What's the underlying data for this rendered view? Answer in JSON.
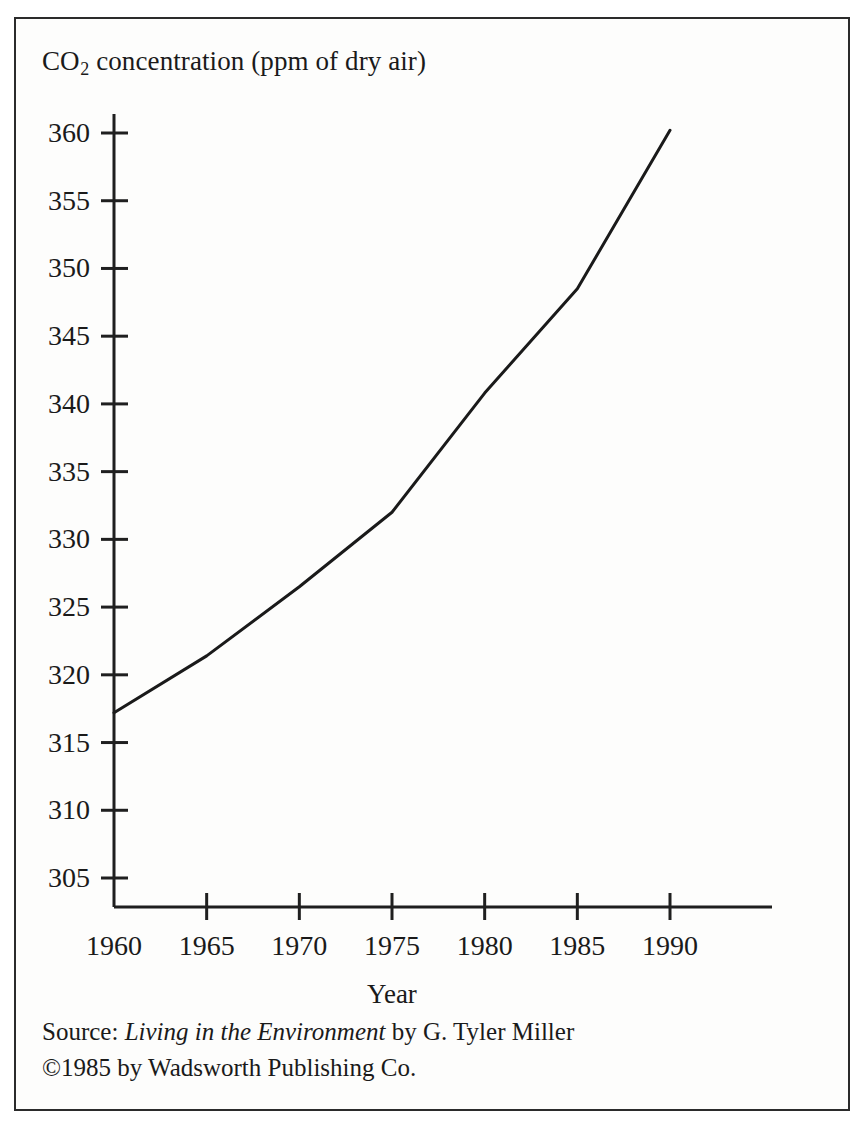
{
  "figure": {
    "title_main": "CO",
    "title_sub": "2",
    "title_rest": " concentration (ppm of dry air)",
    "x_axis_title": "Year",
    "border_color": "#2b2b2b",
    "line_color": "#1a1a1a",
    "background": "#fdfdfc"
  },
  "source": {
    "prefix": "Source:",
    "work_italic": "Living in the Environment",
    "author": "by G. Tyler Miller",
    "copyright": "©1985 by Wadsworth Publishing Co."
  },
  "chart_data": {
    "type": "line",
    "title": "CO2 concentration (ppm of dry air)",
    "xlabel": "Year",
    "ylabel": "CO2 concentration (ppm of dry air)",
    "xlim": [
      1960,
      1990
    ],
    "ylim": [
      305,
      360
    ],
    "xticks": [
      1960,
      1965,
      1970,
      1975,
      1980,
      1985,
      1990
    ],
    "xtick_labels": [
      "1960",
      "1965",
      "1970",
      "1975",
      "1980",
      "1985",
      "1990"
    ],
    "yticks": [
      305,
      310,
      315,
      320,
      325,
      330,
      335,
      340,
      345,
      350,
      355,
      360
    ],
    "ytick_labels": [
      "305",
      "310",
      "315",
      "320",
      "325",
      "330",
      "335",
      "340",
      "345",
      "350",
      "355",
      "360"
    ],
    "grid": false,
    "legend": false,
    "series": [
      {
        "name": "CO2 concentration",
        "x": [
          1960,
          1965,
          1970,
          1975,
          1980,
          1985,
          1990
        ],
        "values": [
          317.2,
          321.4,
          326.5,
          332.0,
          340.8,
          348.5,
          360.2
        ]
      }
    ]
  }
}
